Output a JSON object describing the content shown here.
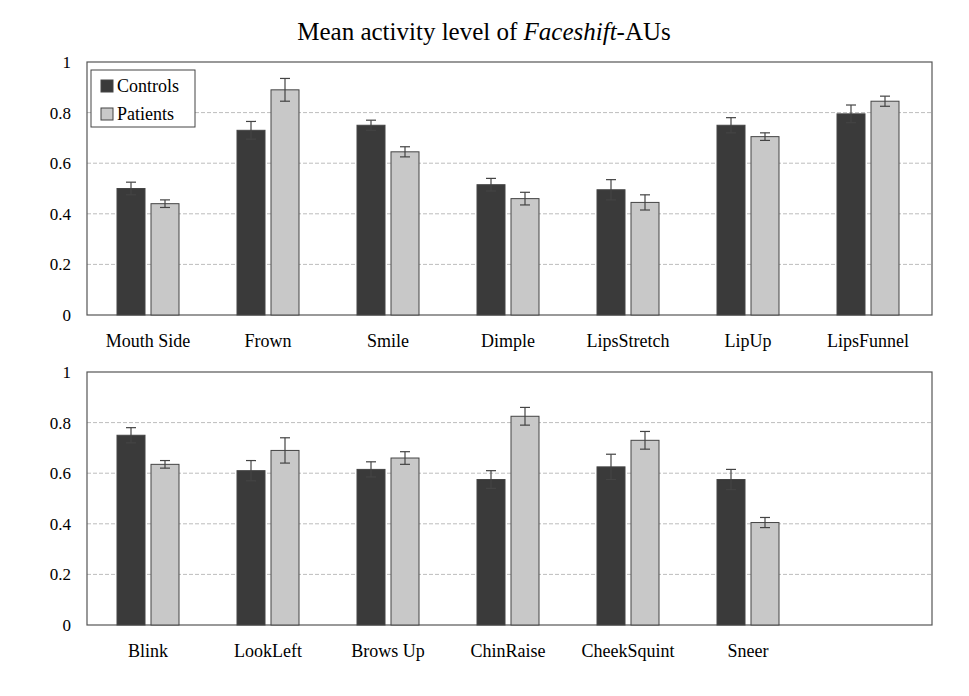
{
  "title": {
    "prefix": "Mean activity level of ",
    "italic": "Faceshift",
    "suffix": "-AUs"
  },
  "legend": [
    {
      "name": "Controls",
      "color": "#3a3a3a"
    },
    {
      "name": "Patients",
      "color": "#c8c8c8"
    }
  ],
  "chart_data": [
    {
      "type": "bar",
      "title": "Mean activity level of Faceshift-AUs",
      "panel": "top",
      "categories": [
        "Mouth Side",
        "Frown",
        "Smile",
        "Dimple",
        "LipsStretch",
        "LipUp",
        "LipsFunnel"
      ],
      "series": [
        {
          "name": "Controls",
          "values": [
            0.5,
            0.73,
            0.75,
            0.515,
            0.495,
            0.75,
            0.795
          ],
          "errors": [
            0.025,
            0.035,
            0.02,
            0.025,
            0.04,
            0.03,
            0.035
          ]
        },
        {
          "name": "Patients",
          "values": [
            0.44,
            0.89,
            0.645,
            0.46,
            0.445,
            0.705,
            0.845
          ],
          "errors": [
            0.015,
            0.045,
            0.02,
            0.025,
            0.03,
            0.015,
            0.02
          ]
        }
      ],
      "xlabel": "",
      "ylabel": "",
      "ylim": [
        0,
        1
      ],
      "yticks": [
        "0",
        "0.2",
        "0.4",
        "0.6",
        "0.8",
        "1"
      ],
      "grid": true,
      "legend_position": "upper left"
    },
    {
      "type": "bar",
      "panel": "bottom",
      "categories": [
        "Blink",
        "LookLeft",
        "Brows Up",
        "ChinRaise",
        "CheekSquint",
        "Sneer"
      ],
      "series": [
        {
          "name": "Controls",
          "values": [
            0.75,
            0.61,
            0.615,
            0.575,
            0.625,
            0.575
          ],
          "errors": [
            0.03,
            0.04,
            0.03,
            0.035,
            0.05,
            0.04
          ]
        },
        {
          "name": "Patients",
          "values": [
            0.635,
            0.69,
            0.66,
            0.825,
            0.73,
            0.405
          ],
          "errors": [
            0.015,
            0.05,
            0.025,
            0.035,
            0.035,
            0.02
          ]
        }
      ],
      "xlabel": "",
      "ylabel": "",
      "ylim": [
        0,
        1
      ],
      "yticks": [
        "0",
        "0.2",
        "0.4",
        "0.6",
        "0.8",
        "1"
      ],
      "grid": true
    }
  ]
}
